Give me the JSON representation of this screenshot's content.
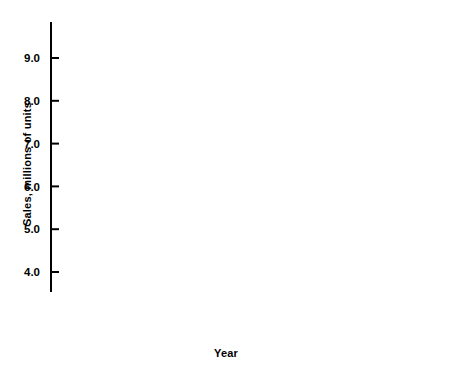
{
  "chart_data": {
    "type": "line",
    "title": "",
    "xlabel": "Year",
    "ylabel": "Sales, millions of units",
    "xlim": [
      1950,
      1976.6
    ],
    "ylim": [
      3.75,
      9.75
    ],
    "grid": false,
    "legend": "none",
    "x": [
      1950,
      1951,
      1952,
      1953,
      1954,
      1955,
      1956,
      1957,
      1958,
      1959,
      1960,
      1961,
      1962,
      1963,
      1964,
      1965,
      1966,
      1967,
      1968,
      1969,
      1970,
      1971,
      1972,
      1973,
      1974,
      1975,
      1976
    ],
    "values": [
      6.45,
      5.35,
      4.2,
      5.6,
      5.55,
      7.65,
      6.0,
      6.15,
      4.1,
      5.65,
      6.55,
      5.4,
      6.95,
      7.4,
      7.55,
      9.0,
      8.4,
      7.0,
      8.4,
      7.45,
      6.0,
      8.1,
      8.4,
      8.95,
      7.4,
      5.95,
      7.9
    ],
    "x_ticks_major": [
      1950,
      1955,
      1960,
      1965,
      1970,
      1975
    ],
    "x_tick_labels": [
      "1950",
      "1955",
      "1960",
      "1965",
      "1970",
      "1975"
    ],
    "x_tick_minor_step": 1,
    "y_ticks_major": [
      4.0,
      5.0,
      6.0,
      7.0,
      8.0,
      9.0
    ],
    "y_tick_labels": [
      "4.0",
      "5.0",
      "6.0",
      "7.0",
      "8.0",
      "9.0"
    ],
    "y_tick_minor": [
      4.5,
      5.5,
      6.5,
      7.5,
      8.5,
      9.5
    ],
    "axis_break": true,
    "line_color": "#000000",
    "axis_color": "#000000",
    "background_color": "#ffffff",
    "line_width": 2.2
  }
}
